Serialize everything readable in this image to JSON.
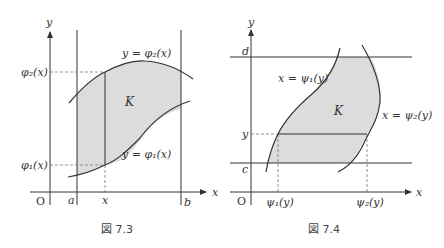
{
  "figure_left": {
    "caption": "図 7.3",
    "axis_x_label": "x",
    "axis_y_label": "y",
    "origin_label": "O",
    "tick_a": "a",
    "tick_b": "b",
    "tick_x": "x",
    "label_phi2_axis": "φ₂(x)",
    "label_phi1_axis": "φ₁(x)",
    "curve_upper_label": "y = φ₂(x)",
    "curve_lower_label": "y = φ₁(x)",
    "region_label": "K"
  },
  "figure_right": {
    "caption": "図 7.4",
    "axis_x_label": "x",
    "axis_y_label": "y",
    "origin_label": "O",
    "tick_c": "c",
    "tick_d": "d",
    "tick_y": "y",
    "label_psi1_axis": "ψ₁(y)",
    "label_psi2_axis": "ψ₂(y)",
    "curve_left_label": "x = ψ₁(y)",
    "curve_right_label": "x = ψ₂(y)",
    "region_label": "K"
  },
  "colors": {
    "region_fill": "#dcdcdc",
    "line": "#333333",
    "dashed": "#777777"
  }
}
